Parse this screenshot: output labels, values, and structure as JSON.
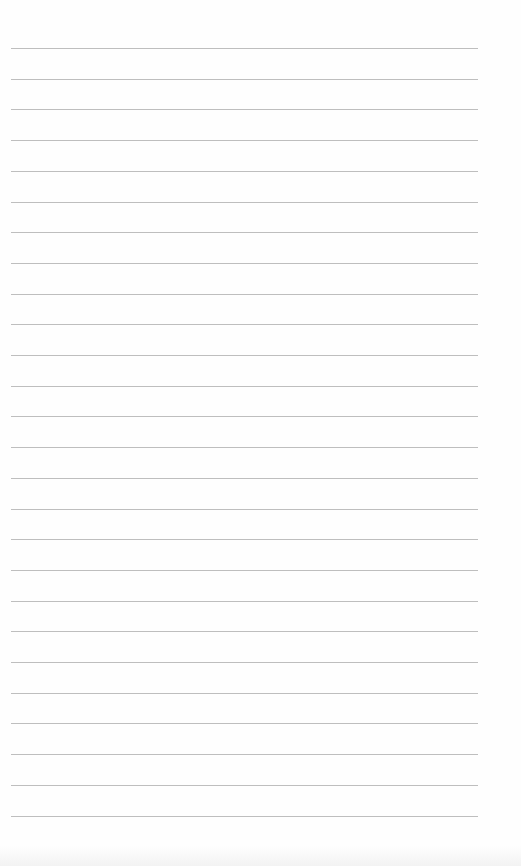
{
  "document": {
    "type": "lined-paper",
    "line_count": 26,
    "first_line_y": 48,
    "line_spacing": 30.7,
    "line_left": 11,
    "line_right": 478,
    "line_color": "#a8a8a8",
    "paper_color": "#fefefe",
    "text": ""
  }
}
